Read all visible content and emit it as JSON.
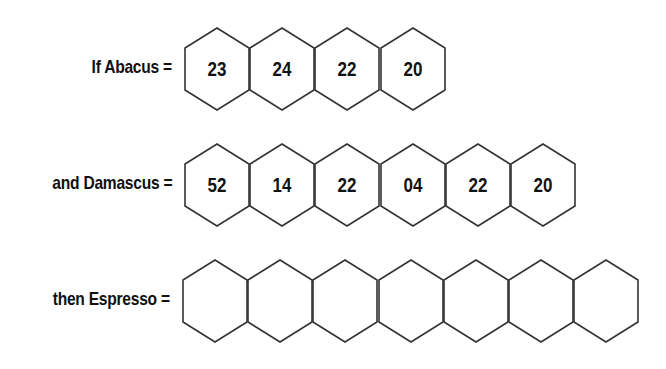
{
  "puzzle": {
    "rows": [
      {
        "label": "If Abacus =",
        "cells": [
          "23",
          "24",
          "22",
          "20"
        ]
      },
      {
        "label": "and Damascus =",
        "cells": [
          "52",
          "14",
          "22",
          "04",
          "22",
          "20"
        ]
      },
      {
        "label": "then Espresso =",
        "cells": [
          "",
          "",
          "",
          "",
          "",
          "",
          ""
        ]
      }
    ]
  }
}
